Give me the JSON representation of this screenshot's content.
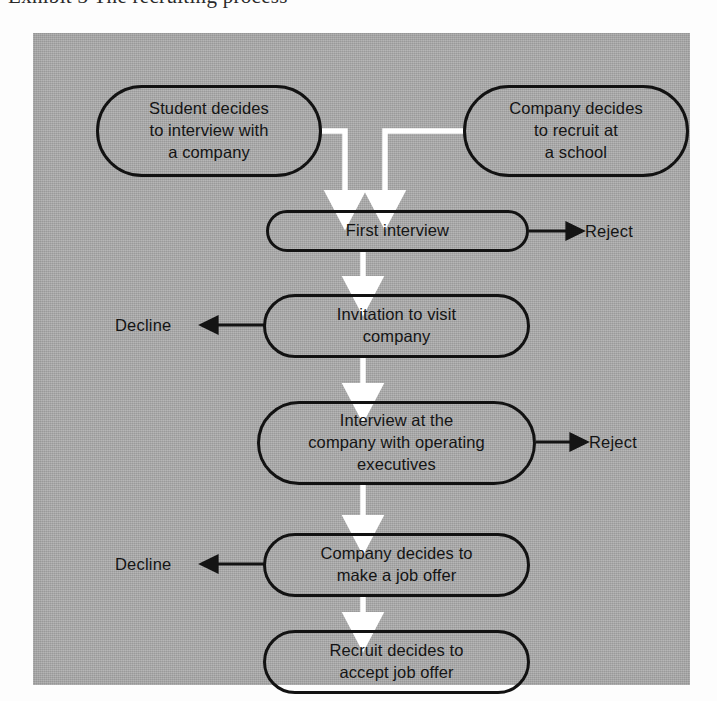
{
  "page": {
    "clipped_caption": "Exhibit 3  The recruiting process"
  },
  "figure": {
    "background_color": "#a9a9a9",
    "ink_color": "#141414",
    "flow_arrow_color": "#ffffff",
    "exit_arrow_color": "#141414"
  },
  "diagram_data": {
    "type": "flowchart",
    "title": "The recruiting process",
    "orientation": "top-to-bottom",
    "nodes": [
      {
        "id": "student-decides",
        "label": "Student decides\nto interview with\na company",
        "shape": "stadium",
        "x": 63,
        "y": 52,
        "width": 226,
        "height": 92
      },
      {
        "id": "company-decides-recruit",
        "label": "Company decides\nto recruit at\na school",
        "shape": "stadium",
        "x": 430,
        "y": 52,
        "width": 226,
        "height": 92
      },
      {
        "id": "first-interview",
        "label": "First interview",
        "shape": "stadium",
        "x": 233,
        "y": 177,
        "width": 263,
        "height": 42
      },
      {
        "id": "invitation-to-visit",
        "label": "Invitation to visit\ncompany",
        "shape": "stadium",
        "x": 230,
        "y": 261,
        "width": 267,
        "height": 64
      },
      {
        "id": "interview-at-company",
        "label": "Interview at the\ncompany with operating\nexecutives",
        "shape": "stadium",
        "x": 224,
        "y": 368,
        "width": 279,
        "height": 84
      },
      {
        "id": "company-job-offer",
        "label": "Company decides to\nmake a job offer",
        "shape": "stadium",
        "x": 230,
        "y": 500,
        "width": 267,
        "height": 64
      },
      {
        "id": "recruit-accepts",
        "label": "Recruit decides to\naccept job offer",
        "shape": "stadium",
        "x": 230,
        "y": 597,
        "width": 267,
        "height": 64
      }
    ],
    "outcomes": [
      {
        "id": "reject-1",
        "label": "Reject",
        "from": "first-interview",
        "direction": "right",
        "x": 552,
        "y": 189
      },
      {
        "id": "decline-1",
        "label": "Decline",
        "from": "invitation-to-visit",
        "direction": "left",
        "x": 115,
        "y": 283
      },
      {
        "id": "reject-2",
        "label": "Reject",
        "from": "interview-at-company",
        "direction": "right",
        "x": 556,
        "y": 400
      },
      {
        "id": "decline-2",
        "label": "Decline",
        "from": "company-job-offer",
        "direction": "left",
        "x": 115,
        "y": 522
      }
    ],
    "edges": [
      {
        "from": "student-decides",
        "to": "first-interview",
        "style": "elbow-down",
        "color": "white"
      },
      {
        "from": "company-decides-recruit",
        "to": "first-interview",
        "style": "elbow-down",
        "color": "white"
      },
      {
        "from": "first-interview",
        "to": "invitation-to-visit",
        "style": "straight-down",
        "color": "white"
      },
      {
        "from": "invitation-to-visit",
        "to": "interview-at-company",
        "style": "straight-down",
        "color": "white"
      },
      {
        "from": "interview-at-company",
        "to": "company-job-offer",
        "style": "straight-down",
        "color": "white"
      },
      {
        "from": "company-job-offer",
        "to": "recruit-accepts",
        "style": "straight-down",
        "color": "white"
      },
      {
        "from": "first-interview",
        "to": "reject-1",
        "style": "straight-right",
        "color": "black"
      },
      {
        "from": "invitation-to-visit",
        "to": "decline-1",
        "style": "straight-left",
        "color": "black"
      },
      {
        "from": "interview-at-company",
        "to": "reject-2",
        "style": "straight-right",
        "color": "black"
      },
      {
        "from": "company-job-offer",
        "to": "decline-2",
        "style": "straight-left",
        "color": "black"
      }
    ]
  }
}
